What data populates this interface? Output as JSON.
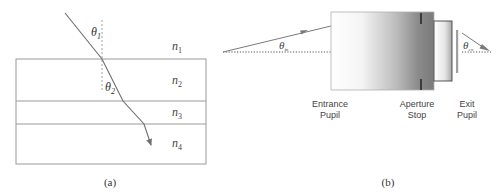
{
  "panel_a": {
    "caption": "(a)",
    "media": [
      {
        "label": "n",
        "sub": "1"
      },
      {
        "label": "n",
        "sub": "2"
      },
      {
        "label": "n",
        "sub": "3"
      },
      {
        "label": "n",
        "sub": "4"
      }
    ],
    "angles": [
      {
        "label": "θ",
        "sub": "1"
      },
      {
        "label": "θ",
        "sub": "2"
      }
    ]
  },
  "panel_b": {
    "caption": "(b)",
    "angle_in": {
      "label": "θ",
      "sub": "in"
    },
    "angle_ex": {
      "label": "θ",
      "sub": "ex"
    },
    "labels": {
      "entrance_line1": "Entrance",
      "entrance_line2": "Pupil",
      "aperture_line1": "Aperture",
      "aperture_line2": "Stop",
      "exit_line1": "Exit",
      "exit_line2": "Pupil"
    }
  },
  "colors": {
    "line": "#8c8c8c",
    "ray": "#707070",
    "text": "#333333",
    "dark": "#555555"
  }
}
